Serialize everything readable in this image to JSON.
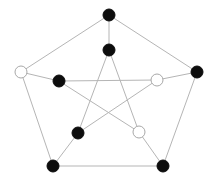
{
  "diagram": {
    "type": "graph",
    "name": "Petersen graph",
    "colors": {
      "edge": "#b5b5b5",
      "filled": "#0d0d0d",
      "empty_fill": "#ffffff",
      "empty_stroke": "#a8a8a8",
      "background": "#ffffff"
    },
    "node_radius": 6,
    "nodes": [
      {
        "id": "o0",
        "x": 109,
        "y": 15,
        "fill": "black"
      },
      {
        "id": "o1",
        "x": 197,
        "y": 72,
        "fill": "black"
      },
      {
        "id": "o2",
        "x": 163,
        "y": 166,
        "fill": "black"
      },
      {
        "id": "o3",
        "x": 53,
        "y": 166,
        "fill": "black"
      },
      {
        "id": "o4",
        "x": 21,
        "y": 72,
        "fill": "white"
      },
      {
        "id": "i0",
        "x": 109,
        "y": 50,
        "fill": "black"
      },
      {
        "id": "i1",
        "x": 157,
        "y": 80,
        "fill": "white"
      },
      {
        "id": "i2",
        "x": 139,
        "y": 132,
        "fill": "white"
      },
      {
        "id": "i3",
        "x": 78,
        "y": 133,
        "fill": "black"
      },
      {
        "id": "i4",
        "x": 59,
        "y": 81,
        "fill": "black"
      }
    ],
    "edges": [
      [
        "o0",
        "o1"
      ],
      [
        "o1",
        "o2"
      ],
      [
        "o2",
        "o3"
      ],
      [
        "o3",
        "o4"
      ],
      [
        "o4",
        "o0"
      ],
      [
        "o0",
        "i0"
      ],
      [
        "o1",
        "i1"
      ],
      [
        "o2",
        "i2"
      ],
      [
        "o3",
        "i3"
      ],
      [
        "o4",
        "i4"
      ],
      [
        "i0",
        "i2"
      ],
      [
        "i2",
        "i4"
      ],
      [
        "i4",
        "i1"
      ],
      [
        "i1",
        "i3"
      ],
      [
        "i3",
        "i0"
      ]
    ]
  }
}
